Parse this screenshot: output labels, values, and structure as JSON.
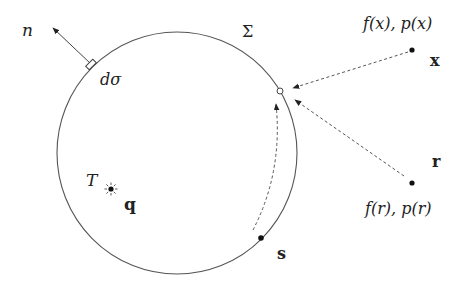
{
  "diagram": {
    "surface_label": "Σ",
    "normal_label": "n",
    "element_label": "dσ",
    "region_label": "T",
    "source_label": "q",
    "point_x": {
      "label": "x",
      "annotation": "f(x), p(x)"
    },
    "point_r": {
      "label": "r",
      "annotation": "f(r), p(r)"
    },
    "point_s": {
      "label": "s"
    },
    "colors": {
      "line": "#555555",
      "dot": "#111111",
      "background": "#ffffff"
    }
  }
}
